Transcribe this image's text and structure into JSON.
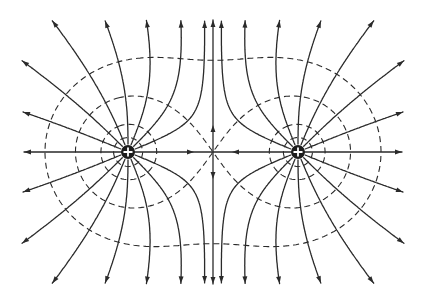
{
  "figure": {
    "background": "#ffffff",
    "ink": "#2a2a2a"
  },
  "charges": [
    {
      "name": "left-charge",
      "x": 128,
      "y": 152,
      "q": 1,
      "sign": "+",
      "radius": 7
    },
    {
      "name": "right-charge",
      "x": 298,
      "y": 152,
      "q": 1,
      "sign": "+",
      "radius": 7
    }
  ],
  "null_point": {
    "x": 213,
    "y": 152
  },
  "field_lines": {
    "count_per_charge": 16,
    "bounds": {
      "xmin": 22,
      "xmax": 404,
      "ymin": 20,
      "ymax": 284
    },
    "arrow_size": 7
  },
  "central_axis": {
    "vertical": {
      "x": 213,
      "y_top": 20,
      "y_bottom": 284
    },
    "center_arrows": "pointing toward null point horizontally, away from null point vertically"
  },
  "equipotentials": {
    "levels_description": "small circles around each charge, figure-eight separatrix through null point, outer oval enclosing both charges",
    "levels": [
      0.075,
      0.042,
      0.02353,
      0.016
    ]
  }
}
